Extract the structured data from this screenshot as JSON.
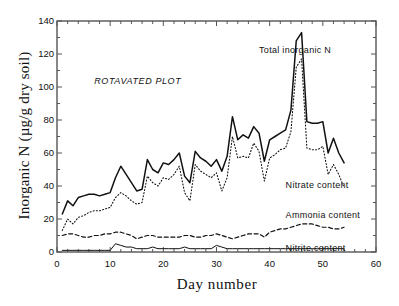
{
  "chart_data": {
    "type": "line",
    "title": "",
    "plot_annotation": "ROTAVATED PLOT",
    "xlabel": "Day number",
    "ylabel": "Inorganic N (µg/g dry soil)",
    "xlim": [
      0,
      60
    ],
    "ylim": [
      0,
      140
    ],
    "xticks": [
      0,
      10,
      20,
      30,
      40,
      50,
      60
    ],
    "yticks": [
      0,
      20,
      40,
      60,
      80,
      100,
      120,
      140
    ],
    "xtick_labels": [
      "0",
      "10",
      "20",
      "30",
      "40",
      "50",
      "60"
    ],
    "ytick_labels": [
      "0",
      "20",
      "40",
      "60",
      "80",
      "100",
      "120",
      "140"
    ],
    "xminor_interval": 2,
    "yminor_interval": 10,
    "grid": false,
    "legend_position": "inline-annotations",
    "axis_color": "#555555",
    "line_color": "#111111",
    "background": "#ffffff",
    "series": [
      {
        "name": "Total inorganic N",
        "label": "Total inorganic N",
        "style": "solid",
        "label_x": 38,
        "label_y": 122,
        "x": [
          1,
          2,
          3,
          4,
          5,
          6,
          7,
          8,
          9,
          10,
          11,
          12,
          13,
          14,
          15,
          16,
          17,
          18,
          19,
          20,
          21,
          22,
          23,
          24,
          25,
          26,
          27,
          28,
          29,
          30,
          31,
          32,
          33,
          34,
          35,
          36,
          37,
          38,
          39,
          40,
          41,
          42,
          43,
          44,
          45,
          46,
          47,
          48,
          49,
          50,
          51,
          52,
          53,
          54
        ],
        "y": [
          23,
          31,
          28,
          33,
          34,
          35,
          35,
          34,
          35,
          36,
          45,
          52,
          47,
          42,
          37,
          38,
          56,
          50,
          48,
          54,
          53,
          56,
          60,
          46,
          42,
          61,
          57,
          55,
          52,
          56,
          49,
          58,
          82,
          68,
          71,
          69,
          76,
          72,
          55,
          68,
          70,
          72,
          74,
          86,
          128,
          133,
          79,
          78,
          78,
          79,
          60,
          69,
          60,
          54
        ]
      },
      {
        "name": "Nitrate content",
        "label": "Nitrate content",
        "style": "dotted",
        "label_x": 43,
        "label_y": 40,
        "x": [
          1,
          2,
          3,
          4,
          5,
          6,
          7,
          8,
          9,
          10,
          11,
          12,
          13,
          14,
          15,
          16,
          17,
          18,
          19,
          20,
          21,
          22,
          23,
          24,
          25,
          26,
          27,
          28,
          29,
          30,
          31,
          32,
          33,
          34,
          35,
          36,
          37,
          38,
          39,
          40,
          41,
          42,
          43,
          44,
          45,
          46,
          47,
          48,
          49,
          50,
          51,
          52,
          53,
          54
        ],
        "y": [
          13,
          20,
          17,
          21,
          22,
          24,
          25,
          25,
          26,
          27,
          33,
          36,
          34,
          31,
          29,
          30,
          46,
          42,
          40,
          45,
          44,
          47,
          52,
          36,
          31,
          53,
          49,
          47,
          45,
          48,
          37,
          45,
          70,
          57,
          58,
          57,
          66,
          61,
          43,
          57,
          59,
          62,
          63,
          73,
          112,
          117,
          63,
          62,
          62,
          64,
          47,
          53,
          47,
          39
        ]
      },
      {
        "name": "Ammonia content",
        "label": "Ammonia content",
        "style": "dashed",
        "label_x": 43,
        "label_y": 22,
        "x": [
          1,
          2,
          3,
          4,
          5,
          6,
          7,
          8,
          9,
          10,
          11,
          12,
          13,
          14,
          15,
          16,
          17,
          18,
          19,
          20,
          21,
          22,
          23,
          24,
          25,
          26,
          27,
          28,
          29,
          30,
          31,
          32,
          33,
          34,
          35,
          36,
          37,
          38,
          39,
          40,
          41,
          42,
          43,
          44,
          45,
          46,
          47,
          48,
          49,
          50,
          51,
          52,
          53,
          54
        ],
        "y": [
          10,
          11,
          11,
          10,
          9,
          9,
          10,
          10,
          11,
          11,
          12,
          12,
          11,
          10,
          8,
          9,
          10,
          10,
          9,
          9,
          9,
          9,
          9,
          10,
          10,
          9,
          9,
          10,
          10,
          11,
          10,
          9,
          8,
          9,
          10,
          11,
          11,
          11,
          9,
          12,
          13,
          14,
          14,
          15,
          16,
          17,
          17,
          17,
          16,
          15,
          15,
          14,
          14,
          15
        ]
      },
      {
        "name": "Nitrite content",
        "label": "Nitrite content",
        "style": "solid-thin",
        "label_x": 43,
        "label_y": 2,
        "x": [
          1,
          2,
          3,
          4,
          5,
          6,
          7,
          8,
          9,
          10,
          11,
          12,
          13,
          14,
          15,
          16,
          17,
          18,
          19,
          20,
          21,
          22,
          23,
          24,
          25,
          26,
          27,
          28,
          29,
          30,
          31,
          32,
          33,
          34,
          35,
          36,
          37,
          38,
          39,
          40,
          41,
          42,
          43,
          44,
          45,
          46,
          47,
          48,
          49,
          50,
          51,
          52,
          53,
          54
        ],
        "y": [
          1,
          1,
          1,
          1,
          1,
          1,
          1,
          1,
          1,
          1,
          5,
          4,
          3,
          3,
          2,
          2,
          2,
          3,
          2,
          2,
          2,
          2,
          2,
          3,
          2,
          2,
          2,
          2,
          2,
          4,
          3,
          2,
          2,
          2,
          2,
          2,
          2,
          2,
          2,
          2,
          2,
          2,
          2,
          2,
          2,
          2,
          2,
          2,
          2,
          2,
          2,
          2,
          2,
          2
        ]
      }
    ]
  }
}
